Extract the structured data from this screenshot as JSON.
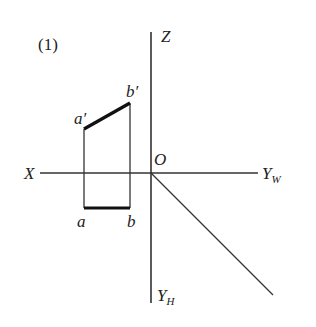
{
  "figure": {
    "number_label": "(1)",
    "axes": {
      "z_label": "Z",
      "x_label": "X",
      "origin_label": "O",
      "yw_label": "Y",
      "yw_sub": "W",
      "yh_label": "Y",
      "yh_sub": "H"
    },
    "points": {
      "a_prime": "a′",
      "b_prime": "b′",
      "a": "a",
      "b": "b"
    },
    "colors": {
      "line": "#222222",
      "background": "#ffffff"
    }
  }
}
